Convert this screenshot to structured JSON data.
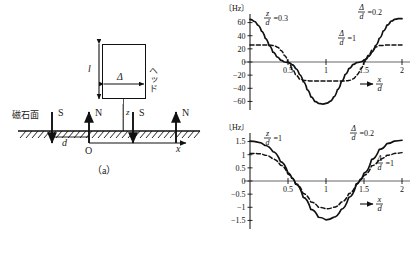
{
  "figure": {
    "panel_a": {
      "caption": "（a）",
      "head_label": "ヘッド",
      "magnet_surface_label": "磁石面",
      "length_label": "l",
      "gap_label": "Δ",
      "height_label": "z",
      "pitch_label": "d",
      "origin_label": "O",
      "x_axis_label": "x",
      "poles": [
        {
          "label": "S",
          "direction": "down"
        },
        {
          "label": "N",
          "direction": "up"
        },
        {
          "label": "S",
          "direction": "down"
        },
        {
          "label": "N",
          "direction": "up"
        }
      ]
    },
    "panel_b": {
      "caption": "（b）"
    }
  },
  "chart_data": [
    {
      "id": "upper",
      "type": "line",
      "title": "",
      "unit_label": "〔Hz〕",
      "xlabel_num": "x",
      "xlabel_den": "d",
      "ylabel": "",
      "xlim": [
        0,
        2
      ],
      "ylim": [
        -70,
        70
      ],
      "xticks": [
        0.5,
        1,
        1.5,
        2
      ],
      "xtick_labels": [
        "0.5",
        "1",
        "1.5",
        "2"
      ],
      "yticks": [
        60,
        40,
        20,
        0,
        -20,
        -40,
        -60
      ],
      "ytick_labels": [
        "60",
        "40",
        "20",
        "0",
        "−20",
        "−40",
        "−60"
      ],
      "grid": false,
      "condition_label": {
        "num": "z",
        "den": "d",
        "value": "0.3"
      },
      "series": [
        {
          "name": "Δ/d = 0.2",
          "style": "solid",
          "label_num": "Δ",
          "label_den": "d",
          "label_value": "0.2",
          "x": [
            0,
            0.05,
            0.1,
            0.15,
            0.2,
            0.25,
            0.3,
            0.35,
            0.4,
            0.45,
            0.5,
            0.55,
            0.6,
            0.65,
            0.7,
            0.75,
            0.8,
            0.85,
            0.9,
            0.95,
            1,
            1.05,
            1.1,
            1.15,
            1.2,
            1.25,
            1.3,
            1.35,
            1.4,
            1.45,
            1.5,
            1.55,
            1.6,
            1.65,
            1.7,
            1.75,
            1.8,
            1.85,
            1.9,
            1.95,
            2
          ],
          "y": [
            65,
            62,
            56,
            47,
            36,
            25,
            15,
            8,
            3,
            0,
            -1,
            -4,
            -10,
            -19,
            -30,
            -42,
            -53,
            -60,
            -63,
            -64,
            -63,
            -60,
            -53,
            -42,
            -30,
            -19,
            -10,
            -4,
            -1,
            0,
            3,
            8,
            15,
            25,
            36,
            47,
            56,
            62,
            65,
            66,
            66
          ]
        },
        {
          "name": "Δ/d = 1",
          "style": "dashed",
          "label_num": "Δ",
          "label_den": "d",
          "label_value": "1",
          "x": [
            0,
            0.1,
            0.2,
            0.3,
            0.35,
            0.4,
            0.45,
            0.5,
            0.55,
            0.6,
            0.65,
            0.7,
            0.8,
            0.9,
            1,
            1.1,
            1.2,
            1.3,
            1.35,
            1.4,
            1.45,
            1.5,
            1.55,
            1.6,
            1.65,
            1.7,
            1.8,
            1.9,
            2
          ],
          "y": [
            26,
            26,
            26,
            25,
            23,
            18,
            10,
            0,
            -11,
            -20,
            -26,
            -28,
            -29,
            -29,
            -29,
            -29,
            -29,
            -28,
            -26,
            -20,
            -11,
            0,
            10,
            18,
            23,
            25,
            26,
            26,
            26
          ]
        }
      ]
    },
    {
      "id": "lower",
      "type": "line",
      "title": "",
      "unit_label": "〔Hz〕",
      "xlabel_num": "x",
      "xlabel_den": "d",
      "ylabel": "",
      "xlim": [
        0,
        2
      ],
      "ylim": [
        -1.75,
        1.75
      ],
      "xticks": [
        0.5,
        1,
        1.5,
        2
      ],
      "xtick_labels": [
        "0.5",
        "1",
        "1.5",
        "2"
      ],
      "yticks": [
        1.5,
        1,
        0.5,
        0,
        -0.5,
        -1,
        -1.5
      ],
      "ytick_labels": [
        "1.5",
        "1",
        "0.5",
        "0",
        "−0.5",
        "−1",
        "−1.5"
      ],
      "grid": false,
      "condition_label": {
        "num": "z",
        "den": "d",
        "value": "1"
      },
      "series": [
        {
          "name": "Δ/d = 0.2",
          "style": "solid",
          "label_num": "Δ",
          "label_den": "d",
          "label_value": "0.2",
          "x": [
            0,
            0.1,
            0.2,
            0.3,
            0.4,
            0.5,
            0.55,
            0.6,
            0.7,
            0.8,
            0.9,
            1,
            1.1,
            1.2,
            1.3,
            1.4,
            1.45,
            1.5,
            1.6,
            1.7,
            1.8,
            1.9,
            2
          ],
          "y": [
            1.52,
            1.48,
            1.35,
            1.12,
            0.74,
            0.3,
            0.12,
            -0.12,
            -0.62,
            -1.08,
            -1.38,
            -1.48,
            -1.38,
            -1.08,
            -0.62,
            -0.12,
            0.06,
            0.3,
            0.82,
            1.2,
            1.42,
            1.52,
            1.55
          ]
        },
        {
          "name": "Δ/d = 1",
          "style": "dashed",
          "label_num": "Δ",
          "label_den": "d",
          "label_value": "1",
          "x": [
            0,
            0.1,
            0.2,
            0.3,
            0.4,
            0.5,
            0.55,
            0.6,
            0.7,
            0.8,
            0.9,
            1,
            1.1,
            1.2,
            1.3,
            1.4,
            1.45,
            1.5,
            1.6,
            1.7,
            1.8,
            1.9,
            2
          ],
          "y": [
            1.05,
            1.04,
            0.98,
            0.84,
            0.6,
            0.26,
            0.1,
            -0.1,
            -0.48,
            -0.8,
            -1.0,
            -1.06,
            -1.0,
            -0.8,
            -0.48,
            -0.1,
            0.04,
            0.22,
            0.58,
            0.82,
            0.98,
            1.05,
            1.08
          ]
        }
      ]
    }
  ]
}
